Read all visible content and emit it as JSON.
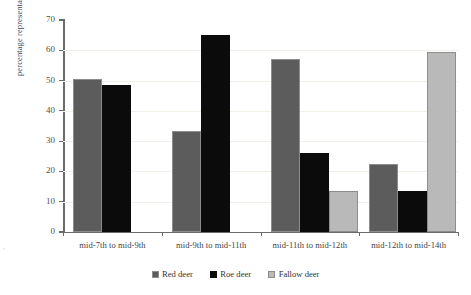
{
  "chart_data": {
    "type": "bar",
    "title": "",
    "xlabel": "",
    "ylabel": "percentage representation",
    "ylim": [
      0,
      70
    ],
    "yticks": [
      0,
      10,
      20,
      30,
      40,
      50,
      60,
      70
    ],
    "grid": false,
    "legend_position": "bottom",
    "categories": [
      "mid-7th to mid-9th",
      "mid-9th to mid-11th",
      "mid-11th to mid-12th",
      "mid-12th to mid-14th"
    ],
    "series": [
      {
        "name": "Red deer",
        "color": "#5c5c5c",
        "values": [
          50.5,
          33.5,
          57.0,
          22.5
        ]
      },
      {
        "name": "Roe deer",
        "color": "#0b0b0b",
        "values": [
          48.5,
          65.0,
          26.0,
          13.5
        ]
      },
      {
        "name": "Fallow deer",
        "color": "#b9b9b9",
        "values": [
          null,
          null,
          13.5,
          59.5
        ]
      }
    ]
  },
  "axis": {
    "y_tick_labels": [
      "0",
      "10",
      "20",
      "30",
      "40",
      "50",
      "60",
      "70"
    ]
  },
  "legend": {
    "items": [
      {
        "label": "Red deer"
      },
      {
        "label": "Roe deer"
      },
      {
        "label": "Fallow deer"
      }
    ]
  },
  "artifacts": {
    "speckle": "."
  }
}
